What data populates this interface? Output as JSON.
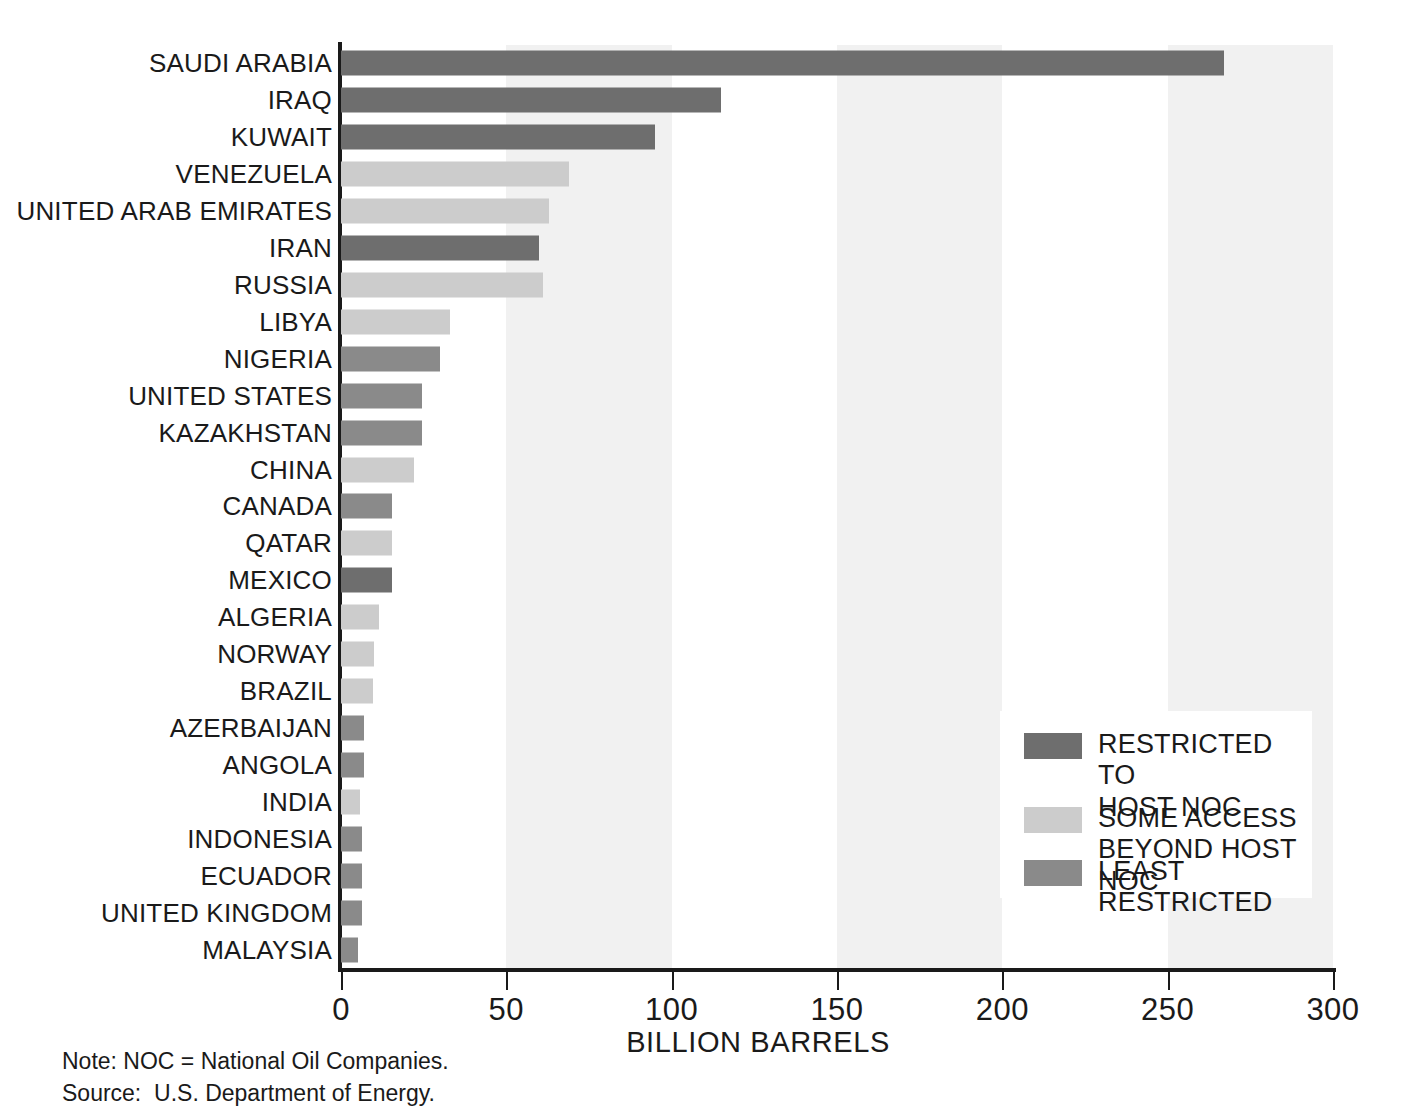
{
  "chart_data": {
    "type": "bar",
    "orientation": "horizontal",
    "title": "",
    "xlabel": "BILLION BARRELS",
    "ylabel": "",
    "xlim": [
      0,
      300
    ],
    "xticks": [
      0,
      50,
      100,
      150,
      200,
      250,
      300
    ],
    "xtick_labels": [
      "0",
      "50",
      "100",
      "150",
      "200",
      "250",
      "300"
    ],
    "grid": false,
    "banding": {
      "description": "alternating light vertical bands",
      "color": "#f1f1f1",
      "ranges": [
        [
          50,
          100
        ],
        [
          150,
          200
        ],
        [
          250,
          300
        ]
      ]
    },
    "legend_position": "inside-right",
    "categories": [
      "SAUDI ARABIA",
      "IRAQ",
      "KUWAIT",
      "VENEZUELA",
      "UNITED ARAB EMIRATES",
      "IRAN",
      "RUSSIA",
      "LIBYA",
      "NIGERIA",
      "UNITED STATES",
      "KAZAKHSTAN",
      "CHINA",
      "CANADA",
      "QATAR",
      "MEXICO",
      "ALGERIA",
      "NORWAY",
      "BRAZIL",
      "AZERBAIJAN",
      "ANGOLA",
      "INDIA",
      "INDONESIA",
      "ECUADOR",
      "UNITED KINGDOM",
      "MALAYSIA"
    ],
    "values": [
      267,
      115,
      95,
      69,
      63,
      60,
      61,
      33,
      30,
      24.5,
      24.5,
      22,
      15.5,
      15.5,
      15.5,
      11.5,
      10,
      9.7,
      7,
      7,
      5.7,
      6.5,
      6.5,
      6.5,
      5
    ],
    "point_colors": [
      "#6e6e6e",
      "#6e6e6e",
      "#6e6e6e",
      "#cccccc",
      "#cccccc",
      "#6e6e6e",
      "#cccccc",
      "#cccccc",
      "#8a8a8a",
      "#8a8a8a",
      "#8a8a8a",
      "#cccccc",
      "#8a8a8a",
      "#cccccc",
      "#6e6e6e",
      "#cccccc",
      "#cccccc",
      "#cccccc",
      "#8a8a8a",
      "#8a8a8a",
      "#cccccc",
      "#8a8a8a",
      "#8a8a8a",
      "#8a8a8a",
      "#8a8a8a"
    ],
    "series": [
      {
        "name": "RESTRICTED TO HOST NOC",
        "color": "#6e6e6e"
      },
      {
        "name": "SOME ACCESS BEYOND HOST NOC",
        "color": "#cccccc"
      },
      {
        "name": "LEAST RESTRICTED",
        "color": "#8a8a8a"
      }
    ]
  },
  "legend": {
    "items": [
      {
        "label": "RESTRICTED TO\nHOST NOC",
        "color": "#6e6e6e"
      },
      {
        "label": "SOME ACCESS\nBEYOND HOST NOC",
        "color": "#cccccc"
      },
      {
        "label": "LEAST RESTRICTED",
        "color": "#8a8a8a"
      }
    ]
  },
  "axis": {
    "x_title": "BILLION BARRELS"
  },
  "footnotes": {
    "note": "Note: NOC = National Oil Companies.",
    "source": "Source:  U.S. Department of Energy."
  },
  "colors": {
    "restricted": "#6e6e6e",
    "some_access": "#cccccc",
    "least_restricted": "#8a8a8a",
    "band": "#f1f1f1",
    "axis": "#1a1a1a",
    "background": "#ffffff"
  }
}
